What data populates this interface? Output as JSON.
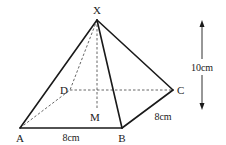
{
  "diagram": {
    "type": "square-based pyramid",
    "vertices": {
      "apex": {
        "label": "X"
      },
      "a": {
        "label": "A"
      },
      "b": {
        "label": "B"
      },
      "c": {
        "label": "C"
      },
      "d": {
        "label": "D"
      },
      "m": {
        "label": "M"
      }
    },
    "dimensions": {
      "ab": "8cm",
      "bc": "8cm",
      "height": "10cm"
    },
    "colors": {
      "line": "#1a1a1a",
      "hidden_line": "#555555",
      "background": "#ffffff"
    }
  }
}
